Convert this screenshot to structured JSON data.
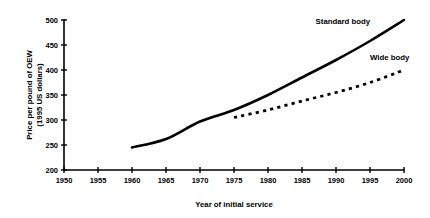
{
  "chart_data": {
    "type": "line",
    "title": "",
    "xlabel": "Year of initial service",
    "ylabel": "Price per pound of OEW (1995 US dollars)",
    "ylabel_line1": "Price per pound of OEW",
    "ylabel_line2": "(1995 US dollars)",
    "xlim": [
      1950,
      2000
    ],
    "ylim": [
      200,
      500
    ],
    "xticks": [
      1950,
      1955,
      1960,
      1965,
      1970,
      1975,
      1980,
      1985,
      1990,
      1995,
      2000
    ],
    "yticks": [
      200,
      250,
      300,
      350,
      400,
      450,
      500
    ],
    "grid": false,
    "legend_position": "inline-annotations",
    "series": [
      {
        "name": "Standard body",
        "style": "solid",
        "color": "#000000",
        "label_x": 1987,
        "label_y": 492,
        "x": [
          1960,
          1965,
          1970,
          1975,
          1980,
          1985,
          1990,
          1995,
          2000
        ],
        "values": [
          245,
          262,
          297,
          320,
          350,
          385,
          420,
          458,
          500
        ]
      },
      {
        "name": "Wide body",
        "style": "dashed",
        "color": "#000000",
        "label_x": 1995,
        "label_y": 420,
        "x": [
          1975,
          1980,
          1985,
          1990,
          1995,
          2000
        ],
        "values": [
          305,
          320,
          338,
          355,
          375,
          400
        ]
      }
    ]
  }
}
